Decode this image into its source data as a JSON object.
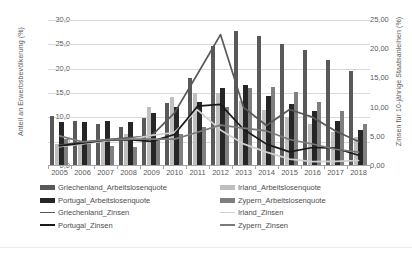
{
  "axes": {
    "y_left_title": "Anteil an Erwerbsbevölkerung (%)",
    "y_right_title": "Zinsen für 10-jährige Staatsanleihen (%)",
    "y_left_ticks": [
      "0,0",
      "5,0",
      "10,0",
      "15,0",
      "20,0",
      "25,0",
      "30,0"
    ],
    "y_right_ticks": [
      "0,00",
      "5,00",
      "10,00",
      "15,00",
      "20,00",
      "25,00"
    ]
  },
  "legend": [
    {
      "label": "Griechenland_Arbeitslosenquote",
      "type": "bar",
      "color": "#595959"
    },
    {
      "label": "Irland_Arbeitslosenquote",
      "type": "bar",
      "color": "#bfbfbf"
    },
    {
      "label": "Portugal_Arbeitslosenquote",
      "type": "bar",
      "color": "#262626"
    },
    {
      "label": "Zypern_Arbeitslosenquote",
      "type": "bar",
      "color": "#7f7f7f"
    },
    {
      "label": "Griechenland_Zinsen",
      "type": "line",
      "color": "#595959"
    },
    {
      "label": "Irland_Zinsen",
      "type": "line",
      "color": "#d0d0d0"
    },
    {
      "label": "Portugal_Zinsen",
      "type": "line",
      "color": "#1a1a1a"
    },
    {
      "label": "Zypern_Zinsen",
      "type": "line",
      "color": "#7a7a7a"
    }
  ],
  "caption": "",
  "chart_data": {
    "type": "bar",
    "title": "",
    "subtitle": "",
    "xlabel": "",
    "ylabel": "Anteil an Erwerbsbevölkerung (%)",
    "y2label": "Zinsen für 10-jährige Staatsanleihen (%)",
    "ylim": [
      0,
      30
    ],
    "y2lim": [
      0,
      25
    ],
    "grid": true,
    "legend_position": "bottom",
    "categories": [
      "2005",
      "2006",
      "2007",
      "2008",
      "2009",
      "2010",
      "2011",
      "2012",
      "2013",
      "2014",
      "2015",
      "2016",
      "2017",
      "2018"
    ],
    "bar_series": [
      {
        "name": "Griechenland_Arbeitslosenquote",
        "axis": "left",
        "color": "#595959",
        "values": [
          10.0,
          9.0,
          8.4,
          7.8,
          9.6,
          12.7,
          17.9,
          24.4,
          27.5,
          26.5,
          24.9,
          23.6,
          21.5,
          19.3
        ]
      },
      {
        "name": "Irland_Arbeitslosenquote",
        "axis": "left",
        "color": "#bfbfbf",
        "values": [
          4.4,
          4.5,
          4.7,
          6.4,
          12.0,
          13.9,
          14.7,
          14.7,
          13.1,
          11.3,
          9.9,
          8.4,
          6.7,
          5.8
        ]
      },
      {
        "name": "Portugal_Arbeitslosenquote",
        "axis": "left",
        "color": "#262626",
        "values": [
          8.8,
          8.9,
          9.1,
          8.8,
          10.7,
          12.0,
          12.9,
          15.8,
          16.4,
          14.1,
          12.6,
          11.2,
          9.0,
          7.1
        ]
      },
      {
        "name": "Zypern_Arbeitslosenquote",
        "axis": "left",
        "color": "#7f7f7f",
        "values": [
          5.3,
          4.6,
          3.9,
          3.7,
          5.4,
          6.3,
          7.9,
          11.9,
          15.9,
          16.1,
          15.0,
          13.0,
          11.1,
          8.4
        ]
      }
    ],
    "line_series": [
      {
        "name": "Griechenland_Zinsen",
        "axis": "right",
        "color": "#595959",
        "values": [
          3.59,
          4.07,
          4.5,
          4.8,
          5.17,
          9.09,
          15.75,
          22.5,
          10.05,
          6.93,
          9.67,
          8.36,
          5.98,
          4.19
        ]
      },
      {
        "name": "Irland_Zinsen",
        "axis": "right",
        "color": "#d0d0d0",
        "values": [
          3.33,
          3.77,
          4.31,
          4.53,
          5.23,
          5.74,
          9.6,
          6.17,
          3.79,
          2.37,
          1.18,
          0.74,
          0.8,
          0.94
        ]
      },
      {
        "name": "Portugal_Zinsen",
        "axis": "right",
        "color": "#1a1a1a",
        "values": [
          3.44,
          3.91,
          4.42,
          4.52,
          4.21,
          5.4,
          10.24,
          10.55,
          6.29,
          3.75,
          2.42,
          3.17,
          3.05,
          1.84
        ]
      },
      {
        "name": "Zypern_Zinsen",
        "axis": "right",
        "color": "#7a7a7a",
        "values": [
          5.16,
          4.13,
          4.48,
          4.6,
          4.6,
          4.6,
          5.79,
          7.0,
          6.5,
          6.0,
          4.54,
          3.77,
          2.87,
          2.38
        ]
      }
    ]
  }
}
